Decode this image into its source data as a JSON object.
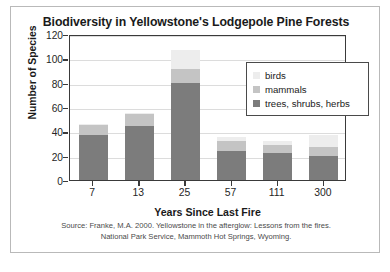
{
  "chart_data": {
    "type": "bar",
    "subtype": "stacked-bar",
    "title": "Biodiversity in Yellowstone's Lodgepole Pine Forests",
    "xlabel": "Years Since Last Fire",
    "ylabel": "Number of Species",
    "categories": [
      "7",
      "13",
      "25",
      "57",
      "111",
      "300"
    ],
    "ylim": [
      0,
      120
    ],
    "yticks": [
      0,
      20,
      40,
      60,
      80,
      100,
      120
    ],
    "ytick_labels": [
      "0",
      "20",
      "40",
      "60",
      "80",
      "100",
      "120"
    ],
    "grid": true,
    "legend_position": "upper-right-inside",
    "series": [
      {
        "name": "trees, shrubs, herbs",
        "color": "#7c7c7c",
        "values": [
          37,
          44,
          80,
          24,
          22,
          20
        ]
      },
      {
        "name": "mammals",
        "color": "#c4c4c4",
        "values": [
          8,
          10,
          11,
          8,
          7,
          7
        ]
      },
      {
        "name": "birds",
        "color": "#ededed",
        "values": [
          1,
          1,
          16,
          3,
          3,
          10
        ]
      }
    ],
    "totals": [
      46,
      55,
      107,
      35,
      32,
      37
    ],
    "source": {
      "line1": "Source: Franke, M.A. 2000. Yellowstone in the afterglow: Lessons from the fires.",
      "line2": "National Park Service, Mammoth Hot Springs, Wyoming."
    },
    "colors": {
      "axis": "#3a3a3a",
      "grid": "#dcdcdc",
      "text": "#1a1a1a",
      "frame": "#b9b9b9",
      "background": "#ffffff"
    }
  }
}
